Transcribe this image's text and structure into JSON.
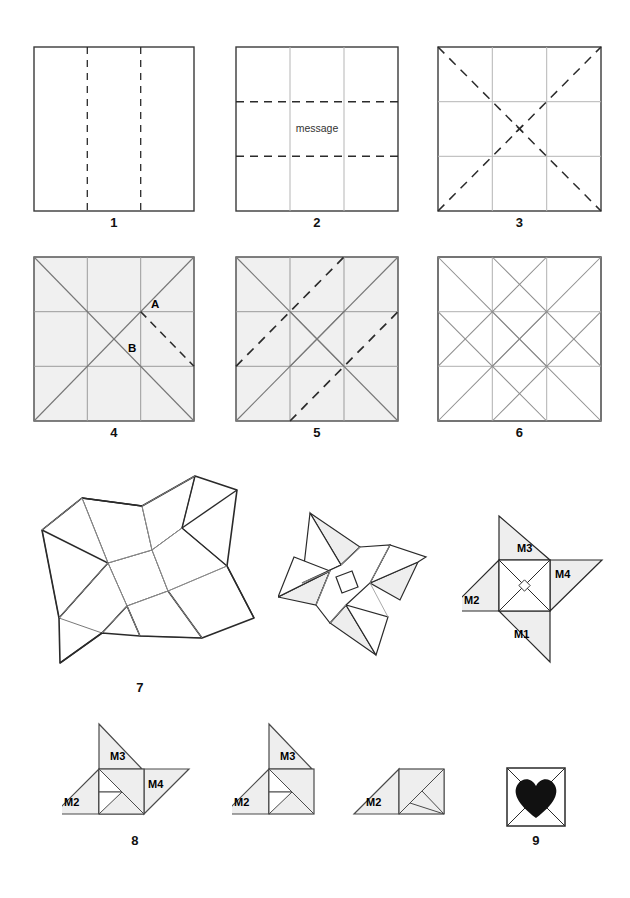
{
  "figure": {
    "background": "#ffffff",
    "stroke_dark": "#333333",
    "stroke_crease": "#b0b0b0",
    "stroke_fold": "#2b2b2b",
    "fill_shaded": "#f0f0f0",
    "fill_white": "#ffffff",
    "heart_color": "#111111"
  },
  "steps": [
    {
      "id": "step-1",
      "number": "1",
      "kind": "square-vertical-thirds",
      "description": "Square sheet with two vertical dashed fold lines at thirds",
      "shaded": false,
      "dashed_lines": [
        "vertical-third-left",
        "vertical-third-right"
      ],
      "crease_lines": []
    },
    {
      "id": "step-2",
      "number": "2",
      "kind": "square-horizontal-thirds",
      "description": "Square with vertical creases and two horizontal dashed fold lines at thirds",
      "shaded": false,
      "message_label": "message",
      "dashed_lines": [
        "horizontal-third-top",
        "horizontal-third-bottom"
      ],
      "crease_lines": [
        "vertical-third-left",
        "vertical-third-right"
      ]
    },
    {
      "id": "step-3",
      "number": "3",
      "kind": "square-diagonals",
      "description": "Square with third creases and two dashed diagonals meeting at centre mark",
      "shaded": false,
      "center_mark": "x",
      "dashed_lines": [
        "diagonal-tl-br",
        "diagonal-bl-tr"
      ],
      "crease_lines": [
        "vertical-third-left",
        "vertical-third-right",
        "horizontal-third-top",
        "horizontal-third-bottom"
      ]
    },
    {
      "id": "step-4",
      "number": "4",
      "kind": "square-shaded-labels-ab",
      "description": "Shaded square with full crease grid, points A and B labelled and one dashed fold",
      "shaded": true,
      "labels": [
        {
          "text": "A",
          "at": "right-of-upper-right-node"
        },
        {
          "text": "B",
          "at": "below-upper-right-node"
        }
      ],
      "dashed_lines": [
        "node-to-right-edge"
      ],
      "crease_lines": [
        "thirds-grid",
        "diagonal-tl-br",
        "diagonal-bl-tr"
      ]
    },
    {
      "id": "step-5",
      "number": "5",
      "kind": "square-shaded-two-dashed-diagonals",
      "description": "Shaded square with crease pattern and two parallel dashed diagonal fold lines",
      "shaded": true,
      "dashed_lines": [
        "upper-parallel-diagonal",
        "lower-parallel-diagonal"
      ],
      "crease_lines": [
        "thirds-grid",
        "diagonals",
        "inner-square-x"
      ]
    },
    {
      "id": "step-6",
      "number": "6",
      "kind": "square-creases-only",
      "description": "Unshaded square showing the completed crease pattern",
      "shaded": false,
      "dashed_lines": [],
      "crease_lines": [
        "thirds-grid",
        "diagonals",
        "inner-square-x"
      ]
    },
    {
      "id": "step-7",
      "number": "7",
      "kind": "pinwheel-3d-large",
      "description": "Large three-dimensional four-armed pinwheel collapse, outline only"
    },
    {
      "id": "step-7b",
      "number": "",
      "kind": "pinwheel-3d-small",
      "description": "Smaller three-dimensional pinwheel part way to flat"
    },
    {
      "id": "step-7c",
      "number": "",
      "kind": "pinwheel-flat-labelled",
      "description": "Flattened pinwheel with four flaps labelled",
      "labels": [
        "M3",
        "M4",
        "M2",
        "M1"
      ]
    },
    {
      "id": "step-8",
      "number": "8",
      "kind": "fold-sequence",
      "description": "Three-stage sequence tucking flaps M4, M3 then M1 leaving M2",
      "stages": [
        {
          "id": "stage-a",
          "labels": [
            "M3",
            "M2",
            "M4"
          ]
        },
        {
          "id": "stage-b",
          "labels": [
            "M3",
            "M2"
          ]
        },
        {
          "id": "stage-c",
          "labels": [
            "M2"
          ]
        }
      ]
    },
    {
      "id": "step-9",
      "number": "9",
      "kind": "finished-envelope-heart",
      "description": "Finished square envelope with diagonal creases and a black heart",
      "heart": true
    }
  ]
}
